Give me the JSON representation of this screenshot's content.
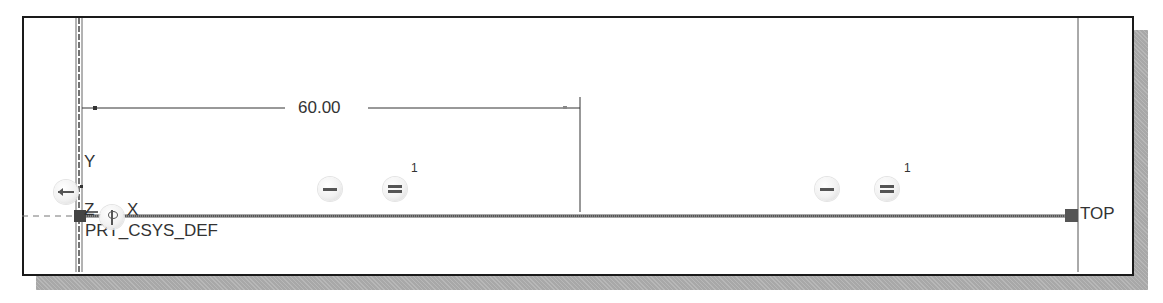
{
  "sketch": {
    "dimension": {
      "value": "60.00"
    },
    "coordinate_system": {
      "label": "PRT_CSYS_DEF",
      "axes": {
        "y": "Y",
        "z": "Z",
        "x": "X"
      }
    },
    "datum_plane_label": "TOP",
    "constraints": [
      {
        "type": "horizontal",
        "symbol": "—"
      },
      {
        "type": "equal",
        "symbol": "=",
        "index": "1"
      },
      {
        "type": "horizontal",
        "symbol": "—"
      },
      {
        "type": "equal",
        "symbol": "=",
        "index": "1"
      }
    ]
  },
  "colors": {
    "line": "#333333",
    "sketch_line": "#555555",
    "shadow": "#a8a8a8",
    "frame": "#1a1a1a"
  }
}
